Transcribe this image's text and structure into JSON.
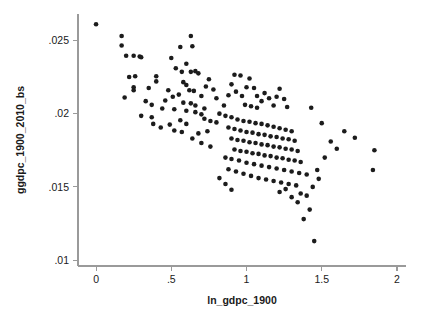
{
  "chart_data": {
    "type": "scatter",
    "title": "",
    "xlabel": "ln_gdpc_1900",
    "ylabel": "ggdpc_1900_2010_bs",
    "xlim": [
      -0.12,
      2.06
    ],
    "ylim": [
      0.0096,
      0.0268
    ],
    "xticks": [
      0,
      0.5,
      1,
      1.5,
      2
    ],
    "xticklabels": [
      "0",
      ".5",
      "1",
      "1.5",
      "2"
    ],
    "yticks": [
      0.01,
      0.015,
      0.02,
      0.025
    ],
    "yticklabels": [
      ".01",
      ".015",
      ".02",
      ".025"
    ],
    "grid": false,
    "legend": null,
    "marker": {
      "shape": "circle",
      "color": "#1c1c1c",
      "size_px": 2.3
    },
    "axis_color": "#9a9a9a",
    "series": [
      {
        "name": "countries",
        "n": 178,
        "points": [
          [
            0.0,
            0.0261
          ],
          [
            0.17,
            0.0253
          ],
          [
            0.17,
            0.02465
          ],
          [
            0.2,
            0.02395
          ],
          [
            0.25,
            0.02395
          ],
          [
            0.29,
            0.0239
          ],
          [
            0.3,
            0.02385
          ],
          [
            0.22,
            0.0225
          ],
          [
            0.26,
            0.02255
          ],
          [
            0.25,
            0.0218
          ],
          [
            0.25,
            0.0216
          ],
          [
            0.19,
            0.0211
          ],
          [
            0.33,
            0.02085
          ],
          [
            0.35,
            0.02175
          ],
          [
            0.4,
            0.02255
          ],
          [
            0.4,
            0.0222
          ],
          [
            0.37,
            0.0206
          ],
          [
            0.44,
            0.02035
          ],
          [
            0.52,
            0.0203
          ],
          [
            0.46,
            0.0209
          ],
          [
            0.3,
            0.01985
          ],
          [
            0.37,
            0.01975
          ],
          [
            0.5,
            0.0238
          ],
          [
            0.56,
            0.02455
          ],
          [
            0.63,
            0.0253
          ],
          [
            0.64,
            0.0246
          ],
          [
            0.53,
            0.0231
          ],
          [
            0.6,
            0.0234
          ],
          [
            0.57,
            0.02285
          ],
          [
            0.63,
            0.02285
          ],
          [
            0.66,
            0.0229
          ],
          [
            0.68,
            0.02275
          ],
          [
            0.58,
            0.02215
          ],
          [
            0.6,
            0.02195
          ],
          [
            0.62,
            0.0216
          ],
          [
            0.65,
            0.02155
          ],
          [
            0.55,
            0.0213
          ],
          [
            0.51,
            0.02115
          ],
          [
            0.48,
            0.0216
          ],
          [
            0.58,
            0.02075
          ],
          [
            0.63,
            0.0207
          ],
          [
            0.66,
            0.02055
          ],
          [
            0.7,
            0.0212
          ],
          [
            0.73,
            0.02185
          ],
          [
            0.75,
            0.02235
          ],
          [
            0.78,
            0.02165
          ],
          [
            0.8,
            0.02105
          ],
          [
            0.72,
            0.02035
          ],
          [
            0.6,
            0.0202
          ],
          [
            0.66,
            0.0201
          ],
          [
            0.7,
            0.01995
          ],
          [
            0.56,
            0.01955
          ],
          [
            0.6,
            0.0193
          ],
          [
            0.49,
            0.01925
          ],
          [
            0.52,
            0.01885
          ],
          [
            0.57,
            0.01875
          ],
          [
            0.43,
            0.01905
          ],
          [
            0.38,
            0.0193
          ],
          [
            0.72,
            0.01965
          ],
          [
            0.76,
            0.0195
          ],
          [
            0.8,
            0.0194
          ],
          [
            0.74,
            0.0188
          ],
          [
            0.68,
            0.01865
          ],
          [
            0.64,
            0.0183
          ],
          [
            0.7,
            0.018
          ],
          [
            0.76,
            0.01775
          ],
          [
            0.82,
            0.02
          ],
          [
            0.85,
            0.02055
          ],
          [
            0.88,
            0.02125
          ],
          [
            0.9,
            0.022
          ],
          [
            0.92,
            0.02265
          ],
          [
            0.96,
            0.0226
          ],
          [
            0.93,
            0.0215
          ],
          [
            0.97,
            0.0212
          ],
          [
            1.0,
            0.0218
          ],
          [
            1.02,
            0.0224
          ],
          [
            1.05,
            0.02175
          ],
          [
            1.07,
            0.0212
          ],
          [
            0.99,
            0.0206
          ],
          [
            1.03,
            0.0205
          ],
          [
            1.07,
            0.0204
          ],
          [
            1.1,
            0.02085
          ],
          [
            1.12,
            0.0214
          ],
          [
            1.15,
            0.02105
          ],
          [
            1.18,
            0.02055
          ],
          [
            1.2,
            0.02115
          ],
          [
            1.22,
            0.0217
          ],
          [
            1.25,
            0.021
          ],
          [
            1.27,
            0.02045
          ],
          [
            0.86,
            0.01985
          ],
          [
            0.9,
            0.01975
          ],
          [
            0.94,
            0.0196
          ],
          [
            0.98,
            0.0195
          ],
          [
            1.02,
            0.01945
          ],
          [
            1.06,
            0.01935
          ],
          [
            1.1,
            0.0193
          ],
          [
            1.14,
            0.0192
          ],
          [
            1.18,
            0.0191
          ],
          [
            1.22,
            0.019
          ],
          [
            1.26,
            0.0189
          ],
          [
            1.3,
            0.0188
          ],
          [
            0.88,
            0.01905
          ],
          [
            0.92,
            0.01895
          ],
          [
            0.96,
            0.01885
          ],
          [
            1.0,
            0.01875
          ],
          [
            1.04,
            0.0187
          ],
          [
            1.08,
            0.0186
          ],
          [
            1.12,
            0.01855
          ],
          [
            1.16,
            0.01845
          ],
          [
            1.2,
            0.0184
          ],
          [
            1.24,
            0.0183
          ],
          [
            1.28,
            0.01825
          ],
          [
            1.32,
            0.01815
          ],
          [
            0.9,
            0.0183
          ],
          [
            0.94,
            0.0182
          ],
          [
            0.98,
            0.01815
          ],
          [
            1.02,
            0.01805
          ],
          [
            1.06,
            0.018
          ],
          [
            1.1,
            0.0179
          ],
          [
            1.14,
            0.01785
          ],
          [
            1.18,
            0.01775
          ],
          [
            1.22,
            0.0177
          ],
          [
            1.26,
            0.0176
          ],
          [
            1.3,
            0.01755
          ],
          [
            1.34,
            0.01745
          ],
          [
            0.92,
            0.01755
          ],
          [
            0.96,
            0.01745
          ],
          [
            1.0,
            0.0174
          ],
          [
            1.04,
            0.0173
          ],
          [
            1.08,
            0.01725
          ],
          [
            1.12,
            0.01715
          ],
          [
            1.16,
            0.0171
          ],
          [
            1.2,
            0.017
          ],
          [
            1.24,
            0.01695
          ],
          [
            1.28,
            0.01685
          ],
          [
            1.32,
            0.0168
          ],
          [
            1.36,
            0.0167
          ],
          [
            0.86,
            0.017
          ],
          [
            0.9,
            0.0169
          ],
          [
            0.95,
            0.0168
          ],
          [
            1.0,
            0.01665
          ],
          [
            1.05,
            0.01655
          ],
          [
            1.1,
            0.01645
          ],
          [
            1.15,
            0.01635
          ],
          [
            1.2,
            0.01625
          ],
          [
            1.25,
            0.01615
          ],
          [
            1.3,
            0.01605
          ],
          [
            1.35,
            0.01595
          ],
          [
            1.4,
            0.01585
          ],
          [
            0.88,
            0.0162
          ],
          [
            0.93,
            0.01605
          ],
          [
            0.98,
            0.0159
          ],
          [
            1.03,
            0.01575
          ],
          [
            1.08,
            0.0156
          ],
          [
            1.13,
            0.0155
          ],
          [
            1.18,
            0.0154
          ],
          [
            1.23,
            0.0153
          ],
          [
            1.28,
            0.0152
          ],
          [
            1.33,
            0.0151
          ],
          [
            0.82,
            0.0156
          ],
          [
            0.86,
            0.0152
          ],
          [
            0.9,
            0.0148
          ],
          [
            1.36,
            0.01455
          ],
          [
            1.4,
            0.0144
          ],
          [
            1.44,
            0.015
          ],
          [
            1.48,
            0.01555
          ],
          [
            1.3,
            0.0143
          ],
          [
            1.34,
            0.01395
          ],
          [
            1.26,
            0.01485
          ],
          [
            1.22,
            0.01465
          ],
          [
            1.42,
            0.01345
          ],
          [
            1.38,
            0.0128
          ],
          [
            1.45,
            0.0113
          ],
          [
            1.52,
            0.017
          ],
          [
            1.56,
            0.0181
          ],
          [
            1.6,
            0.0176
          ],
          [
            1.65,
            0.0188
          ],
          [
            1.72,
            0.01835
          ],
          [
            1.85,
            0.0175
          ],
          [
            1.84,
            0.01615
          ],
          [
            1.5,
            0.01935
          ],
          [
            1.43,
            0.0204
          ],
          [
            1.47,
            0.01615
          ]
        ]
      }
    ]
  },
  "axis_titles": {
    "x": "ln_gdpc_1900",
    "y": "ggdpc_1900_2010_bs"
  }
}
